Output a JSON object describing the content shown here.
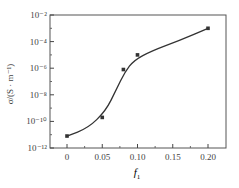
{
  "chart_data": {
    "type": "scatter",
    "title": "",
    "xlabel": "f",
    "xlabel_sub": "1",
    "ylabel": "σ/(S · m⁻¹)",
    "x_ticks": [
      "0",
      "0.05",
      "0.10",
      "0.15",
      "0.20"
    ],
    "x_tick_values": [
      0,
      0.05,
      0.1,
      0.15,
      0.2
    ],
    "y_ticks": [
      "10⁻²",
      "10⁻⁴",
      "10⁻⁶",
      "10⁻⁸",
      "10⁻¹⁰",
      "10⁻¹²"
    ],
    "y_tick_exponents": [
      -2,
      -4,
      -6,
      -8,
      -10,
      -12
    ],
    "xlim": [
      -0.02,
      0.22
    ],
    "ylim_log10": [
      -12,
      -2
    ],
    "y_scale": "log",
    "grid": false,
    "series": [
      {
        "name": "measured",
        "x": [
          0,
          0.05,
          0.08,
          0.1,
          0.2
        ],
        "y": [
          2e-11,
          3e-10,
          1e-06,
          3e-06,
          0.003
        ],
        "log10_y": [
          -11.1,
          -9.7,
          -6.1,
          -5.0,
          -3.0
        ],
        "marker": "square",
        "fit_curve": true
      }
    ]
  }
}
